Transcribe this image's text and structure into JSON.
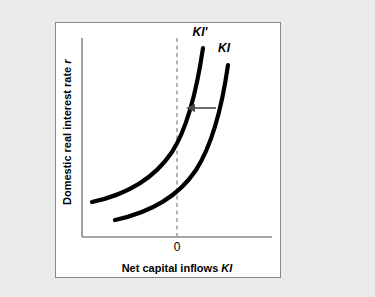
{
  "figure": {
    "background_color": "#ebebeb",
    "panel_color": "#ffffff",
    "panel_border_color": "#8a8a8a",
    "curve_color": "#000000",
    "axis_color": "#8a8a8a",
    "dashed_line_color": "#9a9a9a",
    "arrow_color": "#4a4a4a"
  },
  "chart_data": {
    "type": "line",
    "title": "",
    "xlabel_parts": {
      "plain": "Net capital inflows ",
      "italic": "KI"
    },
    "ylabel_parts": {
      "plain": "Domestic real interest rate ",
      "italic": "r"
    },
    "xlabel": "Net capital inflows KI",
    "ylabel": "Domestic real interest rate r",
    "grid": false,
    "legend_position": "inline-curve-labels",
    "xticks": [
      "0"
    ],
    "yticks": [],
    "annotations": [
      {
        "name": "origin-tick-label",
        "text": "0",
        "x": 177,
        "y": 249
      },
      {
        "name": "shift-arrow",
        "text": "",
        "direction": "left",
        "from_x": 216,
        "to_x": 188,
        "y": 108
      }
    ],
    "reference_lines": [
      {
        "name": "zero-net-inflows-line",
        "orientation": "vertical",
        "value": 0,
        "style": "dashed"
      }
    ],
    "series": [
      {
        "name": "KI'",
        "label": "KI'",
        "label_x": 200,
        "label_y": 36,
        "description": "shifted capital inflows schedule, upward sloping convex curve to the left of KI",
        "path": "M 92 202 C 120 196, 152 182, 172 152 C 190 124, 198 82, 203 48"
      },
      {
        "name": "KI",
        "label": "KI",
        "label_x": 224,
        "label_y": 52,
        "description": "original capital inflows schedule, upward sloping convex curve",
        "path": "M 115 220 C 143 214, 176 200, 196 170 C 214 142, 223 100, 228 65"
      }
    ],
    "axes": {
      "x_start": 82,
      "x_end": 272,
      "y_start": 237,
      "y_end": 38
    }
  }
}
